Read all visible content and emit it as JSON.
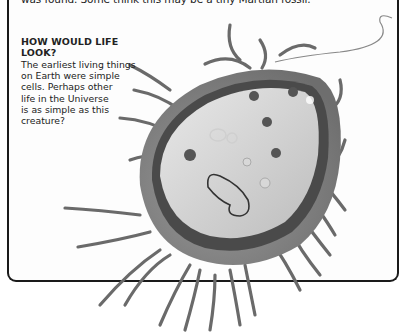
{
  "page": {
    "intro_text_fragment": "was found. Some think this may be a tiny Martian fossil.",
    "sidebar": {
      "heading": "HOW WOULD LIFE LOOK?",
      "body_lines": [
        "The earliest living things",
        "on Earth were simple",
        "cells. Perhaps other",
        "life in the Universe",
        "is as simple as this",
        "creature?"
      ]
    },
    "illustration": {
      "subject": "bacterium-cell-with-pili",
      "style": "grayscale"
    }
  }
}
